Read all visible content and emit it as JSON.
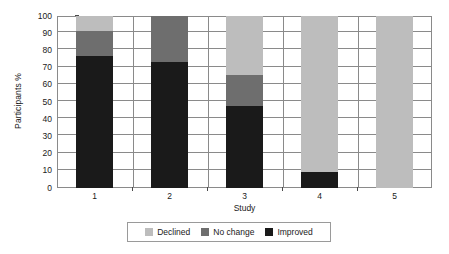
{
  "chart_data": {
    "type": "bar",
    "subtype": "stacked-100-percent",
    "title": "",
    "xlabel": "Study",
    "ylabel": "Participants %",
    "categories": [
      "1",
      "2",
      "3",
      "4",
      "5"
    ],
    "ylim": [
      0,
      100
    ],
    "yticks": [
      0,
      10,
      20,
      30,
      40,
      50,
      60,
      70,
      80,
      90,
      100
    ],
    "ytick_labels": [
      "0",
      "10",
      "20",
      "30",
      "40",
      "50",
      "60",
      "70",
      "80",
      "90",
      "100"
    ],
    "grid": true,
    "grid_axis": "y",
    "legend_position": "bottom",
    "series": [
      {
        "name": "Improved",
        "color": "#1a1a1a",
        "values": [
          76.5,
          73.0,
          47.5,
          9.5,
          0.0
        ]
      },
      {
        "name": "No change",
        "color": "#6e6e6e",
        "values": [
          15.0,
          27.0,
          18.0,
          0.0,
          0.0
        ]
      },
      {
        "name": "Declined",
        "color": "#bdbdbd",
        "values": [
          8.5,
          0.0,
          34.5,
          90.5,
          100.0
        ]
      }
    ],
    "stack_order_bottom_to_top": [
      "Improved",
      "No change",
      "Declined"
    ],
    "legend_entries": [
      {
        "label": "Declined",
        "color": "#bdbdbd",
        "swatch": "legend-swatch-declined"
      },
      {
        "label": "No change",
        "color": "#6e6e6e",
        "swatch": "legend-swatch-no-change"
      },
      {
        "label": "Improved",
        "color": "#1a1a1a",
        "swatch": "legend-swatch-improved"
      }
    ]
  },
  "style": {
    "axis_color": "#8a8a8a",
    "grid_color": "#8a8a8a",
    "text_color": "#1a1a1a",
    "plot_background": "#ffffff",
    "legend_border": "#9a9a9a"
  }
}
